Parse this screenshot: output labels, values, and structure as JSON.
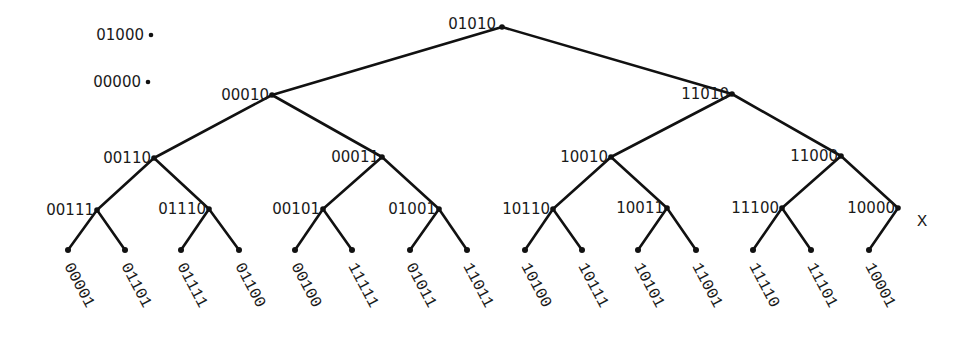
{
  "diagram": {
    "type": "binary-tree",
    "isolated_nodes": [
      {
        "label": "01000",
        "x": 151,
        "y": 35
      },
      {
        "label": "00000",
        "x": 148,
        "y": 82
      }
    ],
    "internal_nodes": [
      {
        "id": "n0",
        "label": "01010",
        "x": 502,
        "y": 27
      },
      {
        "id": "n1",
        "label": "00010",
        "x": 272,
        "y": 95
      },
      {
        "id": "n2",
        "label": "11010",
        "x": 732,
        "y": 94
      },
      {
        "id": "n3",
        "label": "00110",
        "x": 154,
        "y": 158
      },
      {
        "id": "n4",
        "label": "00011",
        "x": 382,
        "y": 157
      },
      {
        "id": "n5",
        "label": "10010",
        "x": 611,
        "y": 157
      },
      {
        "id": "n6",
        "label": "11000",
        "x": 841,
        "y": 156
      },
      {
        "id": "n7",
        "label": "00111",
        "x": 97,
        "y": 210
      },
      {
        "id": "n8",
        "label": "01110",
        "x": 209,
        "y": 209
      },
      {
        "id": "n9",
        "label": "00101",
        "x": 323,
        "y": 209
      },
      {
        "id": "n10",
        "label": "01001",
        "x": 439,
        "y": 209
      },
      {
        "id": "n11",
        "label": "10110",
        "x": 553,
        "y": 209
      },
      {
        "id": "n12",
        "label": "10011",
        "x": 667,
        "y": 208
      },
      {
        "id": "n13",
        "label": "11100",
        "x": 782,
        "y": 208
      },
      {
        "id": "n14",
        "label": "10000",
        "x": 898,
        "y": 208
      }
    ],
    "leaves": [
      {
        "label": "00001",
        "x": 68,
        "y": 250,
        "parent": "n7"
      },
      {
        "label": "01101",
        "x": 125,
        "y": 250,
        "parent": "n7"
      },
      {
        "label": "01111",
        "x": 181,
        "y": 250,
        "parent": "n8"
      },
      {
        "label": "01100",
        "x": 239,
        "y": 250,
        "parent": "n8"
      },
      {
        "label": "00100",
        "x": 295,
        "y": 250,
        "parent": "n9"
      },
      {
        "label": "11111",
        "x": 352,
        "y": 250,
        "parent": "n9"
      },
      {
        "label": "01011",
        "x": 410,
        "y": 250,
        "parent": "n10"
      },
      {
        "label": "11011",
        "x": 467,
        "y": 250,
        "parent": "n10"
      },
      {
        "label": "10100",
        "x": 525,
        "y": 250,
        "parent": "n11"
      },
      {
        "label": "10111",
        "x": 582,
        "y": 250,
        "parent": "n11"
      },
      {
        "label": "10101",
        "x": 638,
        "y": 250,
        "parent": "n12"
      },
      {
        "label": "11001",
        "x": 696,
        "y": 250,
        "parent": "n12"
      },
      {
        "label": "11110",
        "x": 753,
        "y": 250,
        "parent": "n13"
      },
      {
        "label": "11101",
        "x": 811,
        "y": 250,
        "parent": "n13"
      },
      {
        "label": "10001",
        "x": 869,
        "y": 250,
        "parent": "n14"
      }
    ],
    "edges": [
      [
        "n0",
        "n1"
      ],
      [
        "n0",
        "n2"
      ],
      [
        "n1",
        "n3"
      ],
      [
        "n1",
        "n4"
      ],
      [
        "n2",
        "n5"
      ],
      [
        "n2",
        "n6"
      ],
      [
        "n3",
        "n7"
      ],
      [
        "n3",
        "n8"
      ],
      [
        "n4",
        "n9"
      ],
      [
        "n4",
        "n10"
      ],
      [
        "n5",
        "n11"
      ],
      [
        "n5",
        "n12"
      ],
      [
        "n6",
        "n13"
      ],
      [
        "n6",
        "n14"
      ]
    ],
    "side_marker": {
      "label": "X",
      "x": 917,
      "y": 226
    }
  }
}
